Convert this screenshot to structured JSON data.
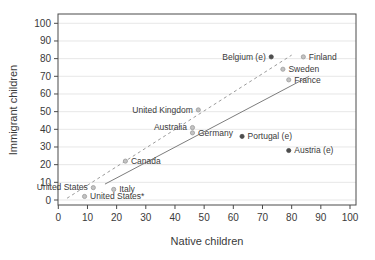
{
  "figure": {
    "background": "#ffffff"
  },
  "chart_data": {
    "type": "scatter",
    "title": "",
    "xlabel": "Native children",
    "ylabel": "Immigrant children",
    "xlim": [
      0,
      100
    ],
    "ylim": [
      0,
      100
    ],
    "xticks": [
      0,
      10,
      20,
      30,
      40,
      50,
      60,
      70,
      80,
      90,
      100
    ],
    "yticks": [
      0,
      10,
      20,
      30,
      40,
      50,
      60,
      70,
      80,
      90,
      100
    ],
    "grid": "horizontal",
    "legend": "none",
    "points": [
      {
        "label": "United States",
        "x": 12,
        "y": 7,
        "marker": "light",
        "label_side": "left"
      },
      {
        "label": "United States*",
        "x": 9,
        "y": 2,
        "marker": "light",
        "label_side": "right"
      },
      {
        "label": "Italy",
        "x": 19,
        "y": 6,
        "marker": "light",
        "label_side": "right"
      },
      {
        "label": "Canada",
        "x": 23,
        "y": 22,
        "marker": "light",
        "label_side": "right"
      },
      {
        "label": "Australia",
        "x": 46,
        "y": 41,
        "marker": "light",
        "label_side": "left"
      },
      {
        "label": "Germany",
        "x": 46,
        "y": 38,
        "marker": "light",
        "label_side": "right"
      },
      {
        "label": "United Kingdom",
        "x": 48,
        "y": 51,
        "marker": "light",
        "label_side": "left"
      },
      {
        "label": "Portugal (e)",
        "x": 63,
        "y": 36,
        "marker": "dark",
        "label_side": "right"
      },
      {
        "label": "Austria (e)",
        "x": 79,
        "y": 28,
        "marker": "dark",
        "label_side": "right"
      },
      {
        "label": "Belgium (e)",
        "x": 73,
        "y": 81,
        "marker": "dark",
        "label_side": "left"
      },
      {
        "label": "Sweden",
        "x": 77,
        "y": 74,
        "marker": "light",
        "label_side": "right"
      },
      {
        "label": "France",
        "x": 79,
        "y": 68,
        "marker": "light",
        "label_side": "right"
      },
      {
        "label": "Finland",
        "x": 84,
        "y": 81,
        "marker": "light",
        "label_side": "right"
      }
    ],
    "lines": [
      {
        "name": "dashed-reference-line",
        "style": "dashed",
        "x1": 3,
        "y1": 1,
        "x2": 80,
        "y2": 82
      },
      {
        "name": "solid-fit-line",
        "style": "solid",
        "x1": 16,
        "y1": 9,
        "x2": 86,
        "y2": 70
      }
    ],
    "style": {
      "marker_light_fill": "#c3c3c3",
      "marker_light_stroke": "#9a9a9a",
      "marker_dark_fill": "#4d4d4d",
      "dashed_line_color": "#9b9b9b",
      "solid_line_color": "#7d7d7d",
      "grid_color": "#e4e4e4",
      "axis_color": "#4a4a4a",
      "text_color": "#3a3a3a"
    }
  }
}
